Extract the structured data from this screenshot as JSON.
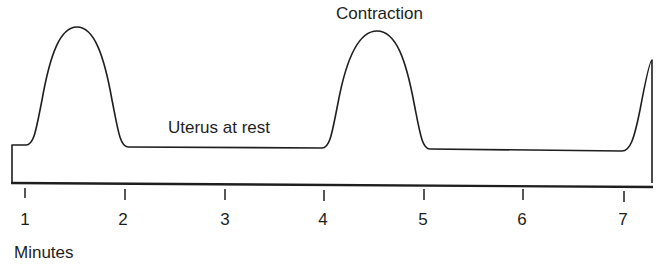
{
  "diagram": {
    "labels": {
      "contraction": "Contraction",
      "rest": "Uterus at rest",
      "axis": "Minutes"
    },
    "axis_ticks": [
      "1",
      "2",
      "3",
      "4",
      "5",
      "6",
      "7"
    ],
    "stroke_color": "#1e1e1e",
    "background": "#ffffff"
  }
}
